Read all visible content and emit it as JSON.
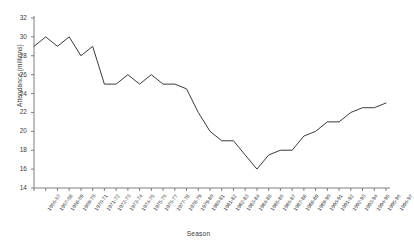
{
  "chart_data": {
    "type": "line",
    "title": "",
    "xlabel": "Season",
    "ylabel": "Attendance (millions)",
    "ylim": [
      14,
      32
    ],
    "yticks": [
      14,
      16,
      18,
      20,
      22,
      24,
      26,
      28,
      30,
      32
    ],
    "grid": false,
    "legend": false,
    "line_color": "#3a3a3a",
    "categories": [
      "1966-67",
      "1967-68",
      "1968-69",
      "1969-70",
      "1970-71",
      "1971-72",
      "1972-73",
      "1973-74",
      "1974-75",
      "1975-76",
      "1976-77",
      "1977-78",
      "1978-79",
      "1979-80",
      "1980-81",
      "1981-82",
      "1982-83",
      "1983-84",
      "1984-85",
      "1985-86",
      "1986-87",
      "1987-88",
      "1988-89",
      "1989-90",
      "1990-91",
      "1991-92",
      "1992-93",
      "1993-94",
      "1994-95",
      "1995-96",
      "1996-97"
    ],
    "values": [
      29,
      30,
      29,
      30,
      28,
      29,
      25,
      25,
      26,
      25,
      26,
      25,
      25,
      24.5,
      22,
      20,
      19,
      19,
      17.5,
      16,
      17.5,
      18,
      18,
      19.5,
      20,
      21,
      21,
      22,
      22.5,
      22.5,
      23
    ]
  }
}
